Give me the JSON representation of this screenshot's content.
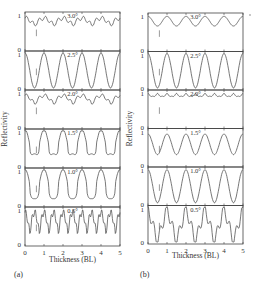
{
  "figure": {
    "panel_a_label": "(a)",
    "panel_b_label": "(b)",
    "xlabel": "Thickness (BL)",
    "ylabel": "Reflectivity"
  },
  "chart_data": [
    {
      "type": "line",
      "panel": "(a)",
      "xlabel": "Thickness (BL)",
      "ylabel": "Reflectivity",
      "xlim": [
        0,
        5
      ],
      "ylim": [
        0,
        1
      ],
      "xticks": [
        0,
        1,
        2,
        3,
        4,
        5
      ],
      "yticks": [
        0,
        1
      ],
      "subplots": [
        {
          "angle": "3.0°",
          "period": 1.0,
          "mean": 0.78,
          "amp": 0.1,
          "harm": 0.06,
          "shape": "cusp"
        },
        {
          "angle": "2.5°",
          "period": 1.0,
          "mean": 0.5,
          "amp": 0.5,
          "harm": 0.0,
          "shape": "sine"
        },
        {
          "angle": "2.0°",
          "period": 1.0,
          "mean": 0.78,
          "amp": 0.12,
          "harm": 0.05,
          "shape": "cusp"
        },
        {
          "angle": "1.5°",
          "period": 1.0,
          "mean": 0.62,
          "amp": 0.35,
          "harm": 0.08,
          "shape": "plateau"
        },
        {
          "angle": "1.0°",
          "period": 1.0,
          "mean": 0.55,
          "amp": 0.42,
          "harm": 0.05,
          "shape": "plateau"
        },
        {
          "angle": "0.5°",
          "period": 0.5,
          "mean": 0.6,
          "amp": 0.3,
          "harm": 0.1,
          "shape": "cusp"
        }
      ]
    },
    {
      "type": "line",
      "panel": "(b)",
      "xlabel": "Thickness (BL)",
      "ylabel": "Reflectivity",
      "xlim": [
        0,
        5
      ],
      "ylim": [
        0,
        1
      ],
      "xticks": [
        0,
        1,
        2,
        3,
        4,
        5
      ],
      "yticks": [
        0,
        1
      ],
      "subplots": [
        {
          "angle": "3.0°",
          "period": 1.0,
          "mean": 0.82,
          "amp": 0.14,
          "harm": 0.0,
          "shape": "sine"
        },
        {
          "angle": "2.5°",
          "period": 1.0,
          "mean": 0.5,
          "amp": 0.5,
          "harm": 0.0,
          "shape": "sine"
        },
        {
          "angle": "2.0°",
          "period": 0.5,
          "mean": 0.9,
          "amp": 0.04,
          "harm": 0.02,
          "shape": "sine"
        },
        {
          "angle": "1.5°",
          "period": 1.0,
          "mean": 0.6,
          "amp": 0.3,
          "harm": 0.0,
          "shape": "sine"
        },
        {
          "angle": "1.0°",
          "period": 1.0,
          "mean": 0.5,
          "amp": 0.48,
          "harm": 0.0,
          "shape": "sine"
        },
        {
          "angle": "0.5°",
          "period": 1.0,
          "mean": 0.5,
          "amp": 0.4,
          "harm": 0.2,
          "shape": "double"
        }
      ]
    }
  ]
}
